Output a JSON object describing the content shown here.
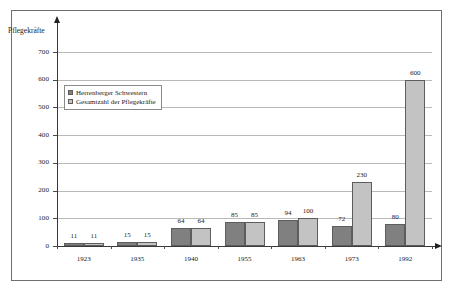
{
  "chart_data": {
    "type": "bar",
    "title": "",
    "xlabel": "",
    "ylabel": "Pflegekräfte",
    "ylim": [
      0,
      700
    ],
    "ytick_step": 100,
    "yticks": [
      0,
      100,
      200,
      300,
      400,
      500,
      600,
      700
    ],
    "ytick_labels": [
      "0",
      "100",
      "200",
      "300",
      "400",
      "500",
      "600",
      "700"
    ],
    "grid": true,
    "grid_axis": "y",
    "legend_position": "upper-left-inside",
    "categories": [
      "1923",
      "1935",
      "1940",
      "1955",
      "1963",
      "1973",
      "1992"
    ],
    "series": [
      {
        "name": "Herrenberger Schwestern",
        "color": "#808080",
        "values": [
          11,
          15,
          64,
          85,
          94,
          72,
          80
        ],
        "value_labels": [
          "11",
          "15",
          "64",
          "85",
          "94",
          "72",
          "80"
        ]
      },
      {
        "name": "Gesamtzahl der Pflegekräfte",
        "color": "#c3c3c3",
        "values": [
          11,
          15,
          64,
          85,
          100,
          230,
          600
        ],
        "value_labels": [
          "11",
          "15",
          "64",
          "85",
          "100",
          "230",
          "600"
        ]
      }
    ]
  },
  "axis": {
    "y_arrow": "arrow-up-icon",
    "x_arrow": "arrow-right-icon"
  }
}
